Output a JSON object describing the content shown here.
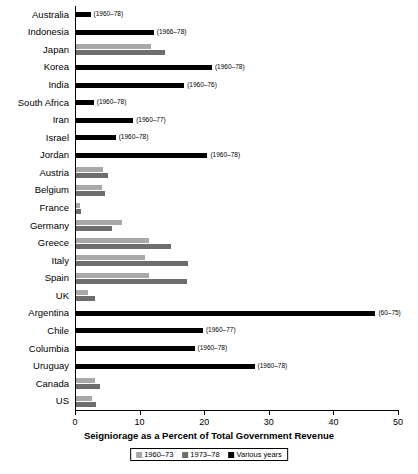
{
  "chart_data": {
    "type": "bar",
    "orientation": "horizontal",
    "title": "",
    "xlabel": "Seigniorage as a Percent of Total Government Revenue",
    "ylabel": "",
    "xlim": [
      0,
      50
    ],
    "xticks": [
      0,
      10,
      20,
      30,
      40,
      50
    ],
    "grid": false,
    "legend_position": "bottom",
    "legend": [
      "1960–73",
      "1973–78",
      "Various years"
    ],
    "series": [
      {
        "name": "1960–73",
        "color": "#a8a8a8",
        "values": [
          null,
          null,
          11.7,
          null,
          null,
          null,
          null,
          null,
          null,
          4.4,
          4.2,
          0.7,
          7.3,
          11.5,
          10.8,
          11.4,
          2.0,
          null,
          null,
          null,
          null,
          3.1,
          2.6
        ]
      },
      {
        "name": "1973–78",
        "color": "#6e6e6e",
        "values": [
          null,
          null,
          13.9,
          null,
          null,
          null,
          null,
          null,
          null,
          5.1,
          4.6,
          1.0,
          5.8,
          14.8,
          17.5,
          17.3,
          3.1,
          null,
          null,
          null,
          null,
          3.8,
          3.2
        ]
      },
      {
        "name": "Various years",
        "color": "#000000",
        "values": [
          2.4,
          12.2,
          null,
          21.2,
          16.9,
          2.9,
          9.0,
          6.3,
          20.5,
          null,
          null,
          null,
          null,
          null,
          null,
          null,
          null,
          46.5,
          19.8,
          18.5,
          27.8,
          null,
          null
        ]
      }
    ],
    "categories": [
      "Australia",
      "Indonesia",
      "Japan",
      "Korea",
      "India",
      "South Africa",
      "Iran",
      "Israel",
      "Jordan",
      "Austria",
      "Belgium",
      "France",
      "Germany",
      "Greece",
      "Italy",
      "Spain",
      "UK",
      "Argentina",
      "Chile",
      "Columbia",
      "Uruguay",
      "Canada",
      "US"
    ],
    "annotations": [
      {
        "category": "Australia",
        "text": "(1960–78)"
      },
      {
        "category": "Indonesia",
        "text": "(1966–78)"
      },
      {
        "category": "Korea",
        "text": "(1960–78)"
      },
      {
        "category": "India",
        "text": "(1960–76)"
      },
      {
        "category": "South Africa",
        "text": "(1960–78)"
      },
      {
        "category": "Iran",
        "text": "(1960–77)"
      },
      {
        "category": "Israel",
        "text": "(1960–78)"
      },
      {
        "category": "Jordan",
        "text": "(1960–78)"
      },
      {
        "category": "Argentina",
        "text": "(60–75)"
      },
      {
        "category": "Chile",
        "text": "(1960–77)"
      },
      {
        "category": "Columbia",
        "text": "(1960–78)"
      },
      {
        "category": "Uruguay",
        "text": "(1960–78)"
      }
    ]
  }
}
